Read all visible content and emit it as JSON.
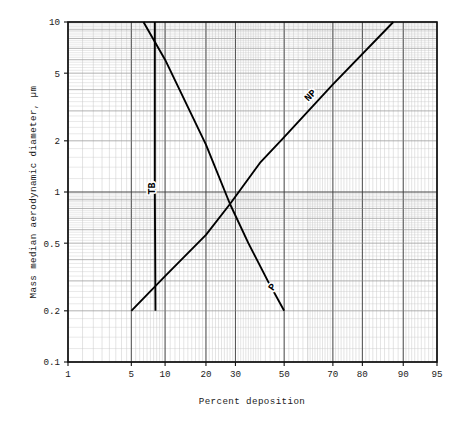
{
  "chart_data": {
    "type": "line",
    "title": "",
    "xlabel": "Percent deposition",
    "ylabel": "Mass median aerodynamic diameter, µm",
    "x_scale": "probability",
    "y_scale": "log",
    "xlim": [
      1,
      95
    ],
    "ylim": [
      0.1,
      10
    ],
    "grid": true,
    "grid_style": "log-probability graph paper, fine minor rulings",
    "legend": "inline curve labels",
    "x_ticks": [
      {
        "value": 1,
        "label": "1"
      },
      {
        "value": 5,
        "label": "5"
      },
      {
        "value": 10,
        "label": "10"
      },
      {
        "value": 20,
        "label": "20"
      },
      {
        "value": 30,
        "label": "30"
      },
      {
        "value": 50,
        "label": "50"
      },
      {
        "value": 70,
        "label": "70"
      },
      {
        "value": 80,
        "label": "80"
      },
      {
        "value": 90,
        "label": "90"
      },
      {
        "value": 95,
        "label": "95"
      }
    ],
    "y_ticks": [
      {
        "value": 10,
        "label": "10"
      },
      {
        "value": 5,
        "label": "5"
      },
      {
        "value": 2,
        "label": "2"
      },
      {
        "value": 1,
        "label": "1"
      },
      {
        "value": 0.5,
        "label": "0.5"
      },
      {
        "value": 0.2,
        "label": "0.2"
      },
      {
        "value": 0.1,
        "label": "0.1"
      }
    ],
    "series": [
      {
        "name": "NP",
        "label": "NP",
        "description": "Nasopharyngeal deposition, ascending line",
        "points": [
          {
            "x": 5,
            "y": 0.2
          },
          {
            "x": 10,
            "y": 0.32
          },
          {
            "x": 20,
            "y": 0.56
          },
          {
            "x": 28,
            "y": 0.85
          },
          {
            "x": 40,
            "y": 1.5
          },
          {
            "x": 50,
            "y": 2.1
          },
          {
            "x": 70,
            "y": 4.3
          },
          {
            "x": 88,
            "y": 10
          }
        ]
      },
      {
        "name": "P",
        "label": "P",
        "description": "Pulmonary deposition, descending line",
        "points": [
          {
            "x": 6.5,
            "y": 10
          },
          {
            "x": 10,
            "y": 6.0
          },
          {
            "x": 20,
            "y": 1.9
          },
          {
            "x": 28,
            "y": 0.85
          },
          {
            "x": 35,
            "y": 0.5
          },
          {
            "x": 43,
            "y": 0.3
          },
          {
            "x": 50,
            "y": 0.2
          }
        ]
      },
      {
        "name": "TB",
        "label": "TB",
        "description": "Tracheobronchial deposition, near-vertical line",
        "points": [
          {
            "x": 8.2,
            "y": 10
          },
          {
            "x": 8.2,
            "y": 1
          },
          {
            "x": 8.3,
            "y": 0.2
          }
        ]
      }
    ],
    "curve_labels": [
      {
        "name": "TB",
        "text": "TB",
        "x": 8.2,
        "y": 1.05,
        "rotation": -90
      },
      {
        "name": "NP",
        "text": "NP",
        "x": 62,
        "y": 3.6,
        "rotation": -45
      },
      {
        "name": "P",
        "text": "P",
        "x": 46,
        "y": 0.27,
        "rotation": -55
      }
    ]
  },
  "axes": {
    "x_title": "Percent deposition",
    "y_title": "Mass median aerodynamic diameter, µm"
  },
  "colors": {
    "background": "#ffffff",
    "frame": "#101010",
    "curve": "#000000",
    "grid_major": "#4a4a4a",
    "grid_minor": "#b9b9b9",
    "text": "#1a1a1a"
  }
}
